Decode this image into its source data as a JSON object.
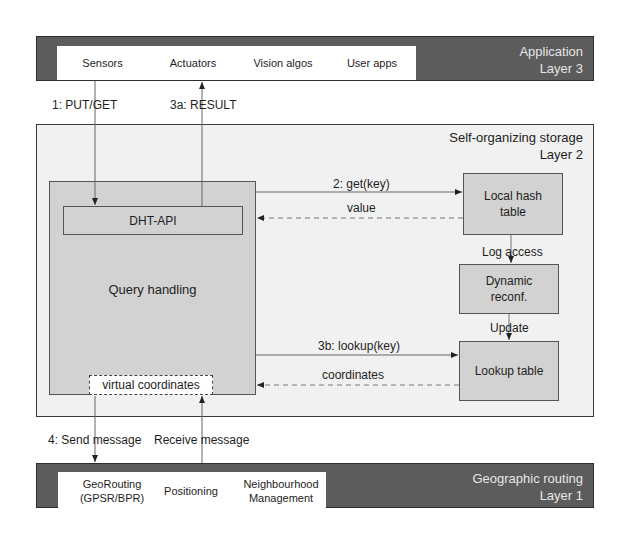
{
  "layer3": {
    "title_line1": "Application",
    "title_line2": "Layer 3",
    "cells": [
      {
        "label": "Sensors"
      },
      {
        "label": "Actuators"
      },
      {
        "label": "Vision algos"
      },
      {
        "label": "User apps"
      }
    ]
  },
  "layer2": {
    "title_line1": "Self-organizing storage",
    "title_line2": "Layer 2",
    "query_handling": "Query handling",
    "dht_api": "DHT-API",
    "virtual_coordinates": "virtual coordinates",
    "local_hash_table": "Local hash table",
    "dynamic_reconf": "Dynamic reconf.",
    "lookup_table": "Lookup table"
  },
  "layer1": {
    "title_line1": "Geographic routing",
    "title_line2": "Layer 1",
    "cells": [
      {
        "label": "GeoRouting (GPSR/BPR)"
      },
      {
        "label": "Positioning"
      },
      {
        "label": "Neighbourhood Management"
      }
    ]
  },
  "edges": {
    "put_get": "1: PUT/GET",
    "result": "3a: RESULT",
    "get_key": "2: get(key)",
    "value": "value",
    "log_access": "Log access",
    "update": "Update",
    "lookup_key": "3b: lookup(key)",
    "coordinates": "coordinates",
    "send_message": "4: Send message",
    "receive_message": "Receive message"
  },
  "colors": {
    "layer_bar": "#5c5c5c",
    "storage_bg": "#f1f1f1",
    "component_bg": "#d2d2d2",
    "cell_bg": "#ffffff"
  }
}
